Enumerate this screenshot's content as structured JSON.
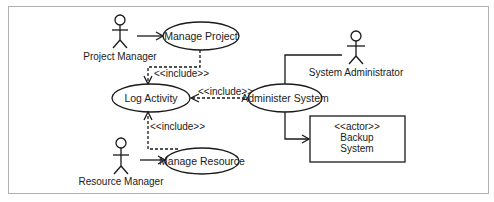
{
  "diagram": {
    "type": "UML use case diagram",
    "frame_color": "#b0b0b0",
    "line_color": "#1a1a1a",
    "actors": [
      {
        "id": "project_manager",
        "label": "Project Manager"
      },
      {
        "id": "resource_manager",
        "label": "Resource Manager"
      },
      {
        "id": "system_administrator",
        "label": "System Administrator"
      }
    ],
    "use_cases": [
      {
        "id": "manage_project",
        "label": "Manage Project"
      },
      {
        "id": "log_activity",
        "label": "Log Activity"
      },
      {
        "id": "administer_system",
        "label": "Administer System"
      },
      {
        "id": "manage_resource",
        "label": "Manage Resource"
      }
    ],
    "external_system": {
      "stereotype": "<<actor>>",
      "line1": "Backup",
      "line2": "System"
    },
    "relationships": [
      {
        "from": "project_manager",
        "to": "manage_project",
        "type": "association"
      },
      {
        "from": "manage_project",
        "to": "log_activity",
        "type": "include",
        "label": "<<include>>"
      },
      {
        "from": "administer_system",
        "to": "log_activity",
        "type": "include",
        "label": "<<include>>"
      },
      {
        "from": "manage_resource",
        "to": "log_activity",
        "type": "include",
        "label": "<<include>>"
      },
      {
        "from": "resource_manager",
        "to": "manage_resource",
        "type": "association"
      },
      {
        "from": "system_administrator",
        "to": "administer_system",
        "type": "association"
      },
      {
        "from": "administer_system",
        "to": "backup_system",
        "type": "association"
      }
    ]
  }
}
